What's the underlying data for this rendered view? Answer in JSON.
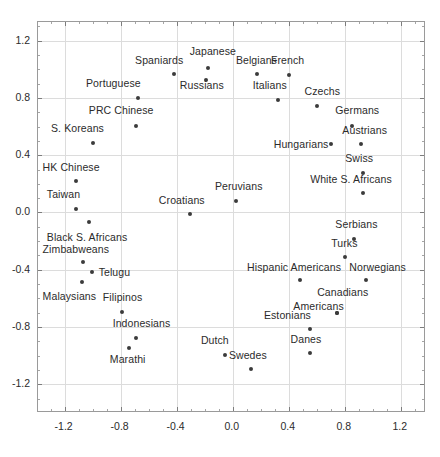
{
  "chart_data": {
    "type": "scatter",
    "title": "",
    "subtitle": "",
    "xlabel": "",
    "ylabel": "",
    "xlim": [
      -1.39,
      1.38
    ],
    "ylim": [
      -1.4,
      1.33
    ],
    "grid": true,
    "legend": "none",
    "xticks": [
      "-1.2",
      "-0.8",
      "-0.4",
      "0.0",
      "0.4",
      "0.8",
      "1.2"
    ],
    "xtick_values": [
      -1.2,
      -0.8,
      -0.4,
      0.0,
      0.4,
      0.8,
      1.2
    ],
    "yticks": [
      "1.2",
      "0.8",
      "0.4",
      "0.0",
      "-0.4",
      "-0.8",
      "-1.2"
    ],
    "ytick_values": [
      1.2,
      0.8,
      0.4,
      0.0,
      -0.4,
      -0.8,
      -1.2
    ],
    "marker_color": "#3b3b3b",
    "grid_color": "#dcdcdc",
    "frame_color": "#9a9a9a",
    "points": [
      {
        "label": "Japanese",
        "x": -0.17,
        "y": 1.0,
        "lx": -0.3,
        "ly": 1.12
      },
      {
        "label": "Spaniards",
        "x": -0.41,
        "y": 0.96,
        "lx": -0.69,
        "ly": 1.06
      },
      {
        "label": "Russians",
        "x": -0.18,
        "y": 0.92,
        "lx": -0.37,
        "ly": 0.88
      },
      {
        "label": "Belgians",
        "x": 0.18,
        "y": 0.96,
        "lx": 0.03,
        "ly": 1.06
      },
      {
        "label": "French",
        "x": 0.41,
        "y": 0.95,
        "lx": 0.28,
        "ly": 1.06
      },
      {
        "label": "Portuguese",
        "x": -0.67,
        "y": 0.79,
        "lx": -1.04,
        "ly": 0.9
      },
      {
        "label": "Italians",
        "x": 0.33,
        "y": 0.78,
        "lx": 0.15,
        "ly": 0.88
      },
      {
        "label": "Czechs",
        "x": 0.61,
        "y": 0.74,
        "lx": 0.52,
        "ly": 0.84
      },
      {
        "label": "PRC Chinese",
        "x": -0.68,
        "y": 0.6,
        "lx": -1.02,
        "ly": 0.71
      },
      {
        "label": "Germans",
        "x": 0.86,
        "y": 0.6,
        "lx": 0.74,
        "ly": 0.71
      },
      {
        "label": "S. Koreans",
        "x": -0.99,
        "y": 0.48,
        "lx": -1.29,
        "ly": 0.58
      },
      {
        "label": "Hungarians",
        "x": 0.71,
        "y": 0.47,
        "lx": 0.3,
        "ly": 0.47
      },
      {
        "label": "Austrians",
        "x": 0.92,
        "y": 0.47,
        "lx": 0.79,
        "ly": 0.57
      },
      {
        "label": "HK Chinese",
        "x": -1.11,
        "y": 0.21,
        "lx": -1.35,
        "ly": 0.31
      },
      {
        "label": "Swiss",
        "x": 0.94,
        "y": 0.27,
        "lx": 0.81,
        "ly": 0.37
      },
      {
        "label": "White S. Africans",
        "x": 0.94,
        "y": 0.13,
        "lx": 0.56,
        "ly": 0.23
      },
      {
        "label": "Peruvians",
        "x": 0.03,
        "y": 0.07,
        "lx": -0.12,
        "ly": 0.18
      },
      {
        "label": "Taiwan",
        "x": -1.11,
        "y": 0.02,
        "lx": -1.32,
        "ly": 0.12
      },
      {
        "label": "Croatians",
        "x": -0.3,
        "y": -0.02,
        "lx": -0.52,
        "ly": 0.08
      },
      {
        "label": "Black S. Africans",
        "x": -1.02,
        "y": -0.07,
        "lx": -1.32,
        "ly": -0.18
      },
      {
        "label": "Serbians",
        "x": 0.87,
        "y": -0.19,
        "lx": 0.74,
        "ly": -0.09
      },
      {
        "label": "Turks",
        "x": 0.81,
        "y": -0.32,
        "lx": 0.71,
        "ly": -0.22
      },
      {
        "label": "Zimbabweans",
        "x": -1.06,
        "y": -0.35,
        "lx": -1.35,
        "ly": -0.26
      },
      {
        "label": "Telugu",
        "x": -1.0,
        "y": -0.42,
        "lx": -0.95,
        "ly": -0.42
      },
      {
        "label": "Hispanic Americans",
        "x": 0.49,
        "y": -0.48,
        "lx": 0.11,
        "ly": -0.39
      },
      {
        "label": "Norwegians",
        "x": 0.96,
        "y": -0.48,
        "lx": 0.84,
        "ly": -0.39
      },
      {
        "label": "Malaysians",
        "x": -1.07,
        "y": -0.49,
        "lx": -1.35,
        "ly": -0.59
      },
      {
        "label": "Canadians",
        "x": 0.75,
        "y": -0.71,
        "lx": 0.61,
        "ly": -0.56
      },
      {
        "label": "Americans",
        "x": 0.75,
        "y": -0.71,
        "lx": 0.44,
        "ly": -0.66
      },
      {
        "label": "Filipinos",
        "x": -0.78,
        "y": -0.7,
        "lx": -0.92,
        "ly": -0.6
      },
      {
        "label": "Estonians",
        "x": 0.56,
        "y": -0.82,
        "lx": 0.23,
        "ly": -0.72
      },
      {
        "label": "Indonesians",
        "x": -0.68,
        "y": -0.88,
        "lx": -0.85,
        "ly": -0.78
      },
      {
        "label": "Marathi",
        "x": -0.73,
        "y": -0.95,
        "lx": -0.87,
        "ly": -1.03
      },
      {
        "label": "Danes",
        "x": 0.56,
        "y": -0.99,
        "lx": 0.42,
        "ly": -0.89
      },
      {
        "label": "Dutch",
        "x": -0.05,
        "y": -1.0,
        "lx": -0.22,
        "ly": -0.9
      },
      {
        "label": "Swedes",
        "x": 0.14,
        "y": -1.1,
        "lx": -0.02,
        "ly": -1.0
      }
    ]
  }
}
